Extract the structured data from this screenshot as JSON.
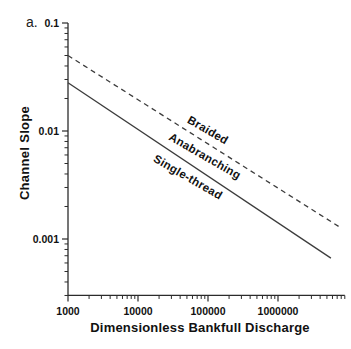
{
  "figure": {
    "panel_label": "a.",
    "background_color": "#ffffff",
    "axis_color": "#2b2b2b",
    "text_color": "#111111"
  },
  "chart_data": {
    "type": "line",
    "title": "",
    "xlabel": "Dimensionless Bankfull Discharge",
    "ylabel": "Channel Slope",
    "x_scale": "log",
    "y_scale": "log",
    "x_range": [
      1000,
      9000000
    ],
    "y_range": [
      0.0003,
      0.1
    ],
    "grid": false,
    "legend": "none (labels placed along lines)",
    "x_major_ticks": [
      {
        "value": 1000,
        "label": "1000"
      },
      {
        "value": 10000,
        "label": "10000"
      },
      {
        "value": 100000,
        "label": "100000"
      },
      {
        "value": 1000000,
        "label": "1000000"
      }
    ],
    "y_major_ticks": [
      {
        "value": 0.1,
        "label": "0.1"
      },
      {
        "value": 0.01,
        "label": "0.01"
      },
      {
        "value": 0.001,
        "label": "0.001"
      }
    ],
    "series": [
      {
        "name": "braided-anabranching boundary",
        "style": "dashed",
        "color": "#3c3c3c",
        "points": [
          [
            1000,
            0.05
          ],
          [
            7900000,
            0.00127
          ]
        ],
        "power_law_exponent": -0.41
      },
      {
        "name": "anabranching-single-thread boundary",
        "style": "solid",
        "color": "#3c3c3c",
        "points": [
          [
            1000,
            0.028
          ],
          [
            5700000,
            0.000665
          ]
        ],
        "power_law_exponent": -0.43
      }
    ],
    "region_labels": [
      {
        "label": "Braided",
        "position": "above dashed line"
      },
      {
        "label": "Anabranching",
        "position": "between dashed and solid lines"
      },
      {
        "label": "Single-thread",
        "position": "below solid line"
      }
    ]
  }
}
